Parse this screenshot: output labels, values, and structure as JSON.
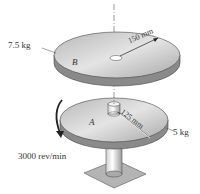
{
  "figure": {
    "disk_b": {
      "letter": "B",
      "mass": "7.5 kg",
      "radius": "150 mm"
    },
    "disk_a": {
      "letter": "A",
      "mass": "5 kg",
      "radius": "125 mm"
    },
    "speed": "3000 rev/min"
  },
  "colors": {
    "disk_top": "#c8c8c8",
    "disk_edge": "#8a8a8a",
    "base": "#b4b4b4",
    "text": "#333333"
  }
}
